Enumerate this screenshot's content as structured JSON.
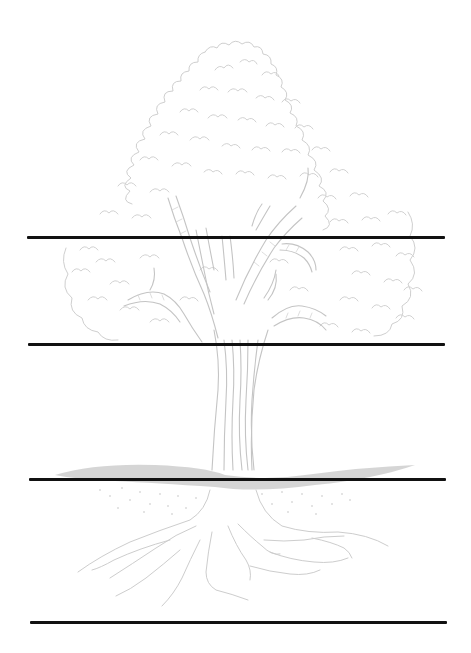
{
  "illustration": {
    "subject": "tree",
    "style": "light pencil sketch",
    "parts": [
      "canopy",
      "branches",
      "trunk",
      "ground",
      "roots"
    ],
    "colors": {
      "background": "#ffffff",
      "sketch_stroke": "#c8c8c8",
      "ground_band": "#b9b9b9",
      "divider_line": "#111111"
    }
  },
  "dividers": [
    {
      "id": "line-1",
      "y": 236,
      "x1": 27,
      "x2": 445
    },
    {
      "id": "line-2",
      "y": 343,
      "x1": 28,
      "x2": 445
    },
    {
      "id": "line-3",
      "y": 478,
      "x1": 29,
      "x2": 446
    },
    {
      "id": "line-4",
      "y": 621,
      "x1": 30,
      "x2": 447
    }
  ]
}
